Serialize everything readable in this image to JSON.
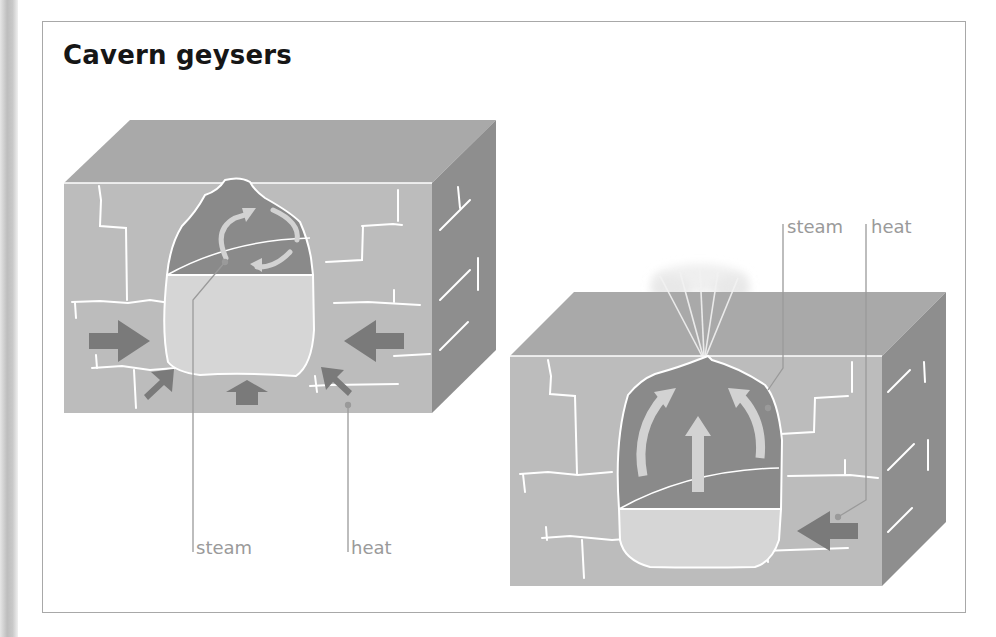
{
  "title": "Cavern geysers",
  "colors": {
    "rock_top": "#a9a9a9",
    "rock_front": "#bcbcbc",
    "rock_side": "#8e8e8e",
    "steam_chamber": "#8a8a8a",
    "water": "#d6d6d6",
    "pressure_arrow": "#7a7a7a",
    "flow_arrow": "#d2d2d2",
    "crack": "#ffffff",
    "label_text": "#9a9a9a",
    "frame": "#a8a8a8"
  },
  "panels": [
    {
      "id": "before-eruption",
      "labels": {
        "steam": "steam",
        "heat": "heat"
      }
    },
    {
      "id": "eruption",
      "labels": {
        "steam": "steam",
        "heat": "heat"
      }
    }
  ]
}
